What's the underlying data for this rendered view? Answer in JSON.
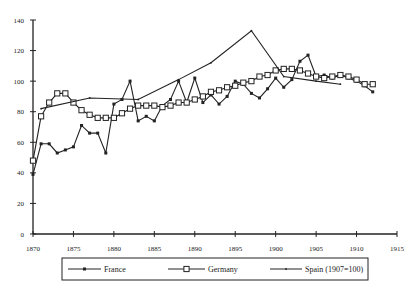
{
  "chart_data": {
    "type": "line",
    "title": "",
    "xlabel": "",
    "ylabel": "",
    "xlim": [
      1870,
      1915
    ],
    "ylim": [
      0,
      140
    ],
    "x_ticks": [
      1870,
      1875,
      1880,
      1885,
      1890,
      1895,
      1900,
      1905,
      1910,
      1915
    ],
    "y_ticks": [
      0,
      20,
      40,
      60,
      80,
      100,
      120,
      140
    ],
    "grid": false,
    "legend_position": "bottom",
    "series": [
      {
        "name": "France",
        "marker": "filled-dot",
        "x": [
          1870,
          1871,
          1872,
          1873,
          1874,
          1875,
          1876,
          1877,
          1878,
          1879,
          1880,
          1881,
          1882,
          1883,
          1884,
          1885,
          1886,
          1887,
          1888,
          1889,
          1890,
          1891,
          1892,
          1893,
          1894,
          1895,
          1896,
          1897,
          1898,
          1899,
          1900,
          1901,
          1902,
          1903,
          1904,
          1905,
          1906,
          1907,
          1908,
          1909,
          1910,
          1911,
          1912
        ],
        "y": [
          39,
          59,
          59,
          53,
          55,
          57,
          71,
          66,
          66,
          53,
          85,
          88,
          100,
          74,
          77,
          74,
          84,
          88,
          100,
          86,
          102,
          86,
          91,
          85,
          90,
          100,
          98,
          92,
          89,
          95,
          102,
          96,
          101,
          113,
          117,
          103,
          104,
          102,
          104,
          102,
          100,
          97,
          93
        ]
      },
      {
        "name": "Germany",
        "marker": "open-square",
        "x": [
          1870,
          1871,
          1872,
          1873,
          1874,
          1875,
          1876,
          1877,
          1878,
          1879,
          1880,
          1881,
          1882,
          1883,
          1884,
          1885,
          1886,
          1887,
          1888,
          1889,
          1890,
          1891,
          1892,
          1893,
          1894,
          1895,
          1896,
          1897,
          1898,
          1899,
          1900,
          1901,
          1902,
          1903,
          1904,
          1905,
          1906,
          1907,
          1908,
          1909,
          1910,
          1911,
          1912
        ],
        "y": [
          48,
          77,
          86,
          92,
          92,
          86,
          81,
          78,
          76,
          76,
          76,
          79,
          82,
          84,
          84,
          84,
          83,
          84,
          86,
          86,
          88,
          90,
          93,
          94,
          96,
          97,
          99,
          100,
          103,
          104,
          107,
          108,
          108,
          107,
          105,
          103,
          102,
          103,
          104,
          103,
          101,
          98,
          98
        ]
      },
      {
        "name": "Spain (1907=100)",
        "marker": "small-dot",
        "x": [
          1871,
          1877,
          1883,
          1888,
          1892,
          1897,
          1901,
          1905,
          1908
        ],
        "y": [
          82,
          89,
          88,
          101,
          112,
          133,
          103,
          100,
          98
        ]
      }
    ]
  },
  "legend": {
    "items": [
      {
        "label": "France"
      },
      {
        "label": "Germany"
      },
      {
        "label": "Spain (1907=100)"
      }
    ]
  }
}
